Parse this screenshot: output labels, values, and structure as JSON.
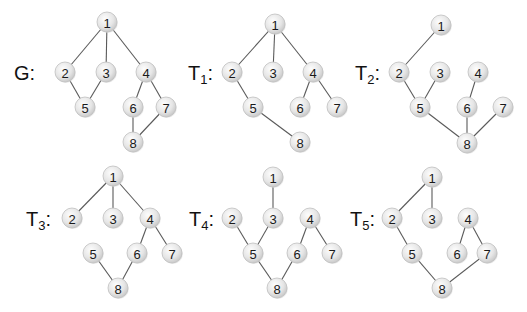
{
  "figure": {
    "node_radius": 10,
    "colors": {
      "edge": "#5a5a5a",
      "node_fill_light": "#fafafa",
      "node_fill_dark": "#cfcfcf",
      "node_stroke": "#bfbfbf",
      "text": "#111111"
    }
  },
  "graphs": [
    {
      "id": "G",
      "label": "G",
      "subscript": "",
      "label_pos": [
        14,
        80
      ],
      "nodes": {
        "1": [
          107,
          22
        ],
        "2": [
          65,
          72
        ],
        "3": [
          106,
          72
        ],
        "4": [
          146,
          72
        ],
        "5": [
          85,
          107
        ],
        "6": [
          133,
          107
        ],
        "7": [
          166,
          107
        ],
        "8": [
          133,
          142
        ]
      },
      "edges": [
        [
          "1",
          "2"
        ],
        [
          "1",
          "3"
        ],
        [
          "1",
          "4"
        ],
        [
          "2",
          "5"
        ],
        [
          "3",
          "5"
        ],
        [
          "4",
          "6"
        ],
        [
          "4",
          "7"
        ],
        [
          "6",
          "8"
        ],
        [
          "7",
          "8"
        ]
      ]
    },
    {
      "id": "T1",
      "label": "T",
      "subscript": "1",
      "label_pos": [
        188,
        80
      ],
      "nodes": {
        "1": [
          275,
          24
        ],
        "2": [
          232,
          72
        ],
        "3": [
          273,
          72
        ],
        "4": [
          313,
          72
        ],
        "5": [
          253,
          107
        ],
        "6": [
          300,
          107
        ],
        "7": [
          337,
          107
        ],
        "8": [
          300,
          142
        ]
      },
      "edges": [
        [
          "1",
          "2"
        ],
        [
          "1",
          "3"
        ],
        [
          "1",
          "4"
        ],
        [
          "2",
          "5"
        ],
        [
          "4",
          "6"
        ],
        [
          "4",
          "7"
        ],
        [
          "5",
          "8"
        ]
      ]
    },
    {
      "id": "T2",
      "label": "T",
      "subscript": "2",
      "label_pos": [
        355,
        80
      ],
      "nodes": {
        "1": [
          441,
          25
        ],
        "2": [
          399,
          72
        ],
        "3": [
          440,
          72
        ],
        "4": [
          478,
          72
        ],
        "5": [
          420,
          107
        ],
        "6": [
          467,
          107
        ],
        "7": [
          503,
          107
        ],
        "8": [
          467,
          143
        ]
      },
      "edges": [
        [
          "1",
          "2"
        ],
        [
          "2",
          "5"
        ],
        [
          "3",
          "5"
        ],
        [
          "4",
          "6"
        ],
        [
          "5",
          "8"
        ],
        [
          "6",
          "8"
        ],
        [
          "7",
          "8"
        ]
      ]
    },
    {
      "id": "T3",
      "label": "T",
      "subscript": "3",
      "label_pos": [
        26,
        226
      ],
      "nodes": {
        "1": [
          113,
          176
        ],
        "2": [
          72,
          218
        ],
        "3": [
          113,
          218
        ],
        "4": [
          150,
          218
        ],
        "5": [
          93,
          253
        ],
        "6": [
          137,
          253
        ],
        "7": [
          172,
          253
        ],
        "8": [
          118,
          288
        ]
      },
      "edges": [
        [
          "1",
          "2"
        ],
        [
          "1",
          "3"
        ],
        [
          "1",
          "4"
        ],
        [
          "4",
          "6"
        ],
        [
          "4",
          "7"
        ],
        [
          "5",
          "8"
        ],
        [
          "6",
          "8"
        ]
      ]
    },
    {
      "id": "T4",
      "label": "T",
      "subscript": "4",
      "label_pos": [
        189,
        226
      ],
      "nodes": {
        "1": [
          273,
          177
        ],
        "2": [
          232,
          218
        ],
        "3": [
          273,
          218
        ],
        "4": [
          310,
          218
        ],
        "5": [
          253,
          253
        ],
        "6": [
          297,
          253
        ],
        "7": [
          332,
          253
        ],
        "8": [
          277,
          288
        ]
      },
      "edges": [
        [
          "1",
          "3"
        ],
        [
          "2",
          "5"
        ],
        [
          "3",
          "5"
        ],
        [
          "4",
          "6"
        ],
        [
          "4",
          "7"
        ],
        [
          "5",
          "8"
        ],
        [
          "6",
          "8"
        ]
      ]
    },
    {
      "id": "T5",
      "label": "T",
      "subscript": "5",
      "label_pos": [
        350,
        226
      ],
      "nodes": {
        "1": [
          432,
          177
        ],
        "2": [
          392,
          218
        ],
        "3": [
          432,
          218
        ],
        "4": [
          468,
          218
        ],
        "5": [
          412,
          253
        ],
        "6": [
          457,
          253
        ],
        "7": [
          487,
          253
        ],
        "8": [
          442,
          288
        ]
      },
      "edges": [
        [
          "1",
          "2"
        ],
        [
          "1",
          "3"
        ],
        [
          "2",
          "5"
        ],
        [
          "4",
          "6"
        ],
        [
          "4",
          "7"
        ],
        [
          "5",
          "8"
        ],
        [
          "7",
          "8"
        ]
      ]
    }
  ]
}
